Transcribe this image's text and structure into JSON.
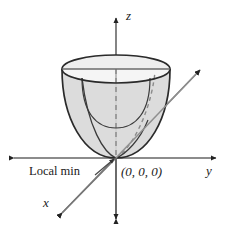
{
  "figure": {
    "background_color": "#ffffff",
    "width": 229,
    "height": 235
  },
  "axes": {
    "z": {
      "label": "z",
      "label_x": 126,
      "label_y": 20,
      "color": "#555555",
      "description": "vertical axis, arrowheads at top and bottom"
    },
    "y": {
      "label": "y",
      "label_x": 206,
      "label_y": 175,
      "color": "#555555",
      "description": "horizontal axis, arrowheads at left and right"
    },
    "x": {
      "label": "x",
      "label_x": 43,
      "label_y": 207,
      "color": "#555555",
      "description": "diagonal axis, arrowhead lower-left and upper-right"
    }
  },
  "annotations": {
    "origin": {
      "text": "(0, 0, 0)",
      "x": 121,
      "y": 176
    },
    "local_min": {
      "text": "Local min",
      "x": 29,
      "y": 175,
      "leader_from_x": 95,
      "leader_from_y": 174,
      "leader_to_x": 114,
      "leader_to_y": 159
    }
  },
  "surface": {
    "name": "paraboloid",
    "fill_color": "#d9d9d9",
    "cap_fill_color": "#f2f2f2",
    "outline_color": "#333333",
    "hidden_line_color": "#777777",
    "vertex_x": 116,
    "vertex_y": 158,
    "rim_center_x": 116,
    "rim_center_y": 69,
    "rim_radius_x": 54,
    "rim_radius_y": 14
  },
  "colors": {
    "ink": "#1a1a1a",
    "axis": "#555555",
    "surface_fill": "#d9d9d9",
    "cap_fill": "#f2f2f2",
    "outline": "#333333",
    "hidden": "#888888"
  }
}
